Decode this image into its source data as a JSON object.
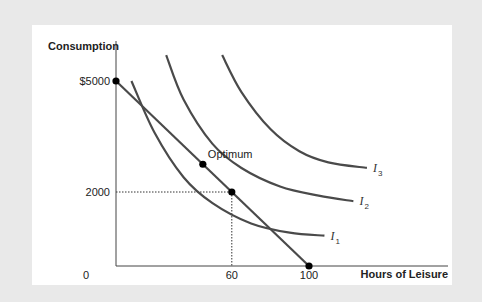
{
  "chart_data": {
    "type": "line",
    "title": "",
    "xlabel": "Hours of Leisure",
    "ylabel": "Consumption",
    "xlim": [
      0,
      130
    ],
    "ylim": [
      0,
      6000
    ],
    "x_ticks": [
      {
        "value": 0,
        "label": "0"
      },
      {
        "value": 60,
        "label": "60"
      },
      {
        "value": 100,
        "label": "100"
      }
    ],
    "y_ticks": [
      {
        "value": 2000,
        "label": "2000"
      },
      {
        "value": 5000,
        "label": "$5000"
      }
    ],
    "budget_line": {
      "name": "Budget constraint",
      "points": [
        [
          0,
          5000
        ],
        [
          100,
          0
        ]
      ]
    },
    "series": [
      {
        "name": "I1",
        "label_main": "I",
        "label_sub": "1",
        "points": [
          [
            8,
            5000
          ],
          [
            20,
            3600
          ],
          [
            35,
            2400
          ],
          [
            50,
            1700
          ],
          [
            70,
            1150
          ],
          [
            90,
            900
          ],
          [
            108,
            820
          ]
        ]
      },
      {
        "name": "I2",
        "label_main": "I",
        "label_sub": "2",
        "points": [
          [
            26,
            5700
          ],
          [
            35,
            4500
          ],
          [
            50,
            3300
          ],
          [
            65,
            2650
          ],
          [
            85,
            2150
          ],
          [
            105,
            1900
          ],
          [
            123,
            1750
          ]
        ]
      },
      {
        "name": "I3",
        "label_main": "I",
        "label_sub": "3",
        "points": [
          [
            55,
            5700
          ],
          [
            65,
            4700
          ],
          [
            80,
            3700
          ],
          [
            95,
            3100
          ],
          [
            110,
            2800
          ],
          [
            130,
            2650
          ]
        ]
      }
    ],
    "points": [
      {
        "name": "endowment-consumption",
        "x": 0,
        "y": 5000,
        "label": ""
      },
      {
        "name": "optimum",
        "x": 45,
        "y": 2750,
        "label": "Optimum"
      },
      {
        "name": "chosen-point",
        "x": 60,
        "y": 2000,
        "label": ""
      },
      {
        "name": "max-leisure",
        "x": 100,
        "y": 0,
        "label": ""
      }
    ],
    "guides": [
      {
        "x": 60,
        "y": 2000,
        "style": "dotted"
      }
    ],
    "grid": false,
    "legend": "none"
  }
}
